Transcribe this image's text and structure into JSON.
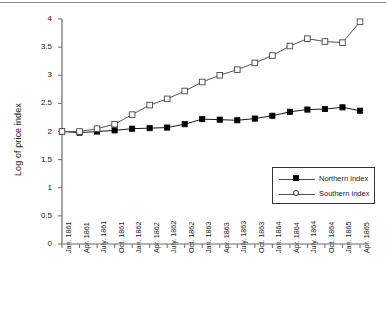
{
  "chart_data": {
    "type": "line",
    "title": "",
    "xlabel": "",
    "ylabel": "Log of price index",
    "ylim": [
      0,
      4
    ],
    "yticks": [
      "0",
      "0.5",
      "1",
      "1.5",
      "2",
      "2.5",
      "3",
      "3.5",
      "4"
    ],
    "ytick_values": [
      0,
      0.5,
      1,
      1.5,
      2,
      2.5,
      3,
      3.5,
      4
    ],
    "grid": false,
    "legend_position": "center-right",
    "categories": [
      "Jan. 1861",
      "Apr. 1861",
      "July. 1861",
      "Oct. 1861",
      "Jan. 1862",
      "Apr. 1862",
      "July. 1862",
      "Oct. 1862",
      "Jan. 1863",
      "Apr. 1863",
      "July. 1863",
      "Oct. 1863",
      "Jan. 1864",
      "Apr. 1864",
      "July. 1864",
      "Oct. 1864",
      "Jan. 1865",
      "Apr. 1865"
    ],
    "series": [
      {
        "name": "Northern index",
        "marker": "filled-square",
        "color": "#000000",
        "values": [
          2.0,
          1.98,
          2.0,
          2.02,
          2.05,
          2.06,
          2.07,
          2.13,
          2.22,
          2.21,
          2.2,
          2.23,
          2.28,
          2.35,
          2.39,
          2.4,
          2.43,
          2.37
        ]
      },
      {
        "name": "Southern index",
        "marker": "open-square",
        "color": "#ffffff",
        "values": [
          2.0,
          2.0,
          2.05,
          2.13,
          2.3,
          2.47,
          2.58,
          2.72,
          2.88,
          3.0,
          3.1,
          3.22,
          3.35,
          3.52,
          3.65,
          3.6,
          3.58,
          3.95
        ]
      }
    ]
  },
  "legend": {
    "entries": [
      {
        "label": "Northern index"
      },
      {
        "label": "Southern index"
      }
    ]
  },
  "axis": {
    "y_title": "Log of price index"
  },
  "colors": {
    "axis": "#6b6b6b",
    "line_north": "#1a1a1a",
    "line_south": "#555555",
    "text": "#1a1a1a"
  }
}
